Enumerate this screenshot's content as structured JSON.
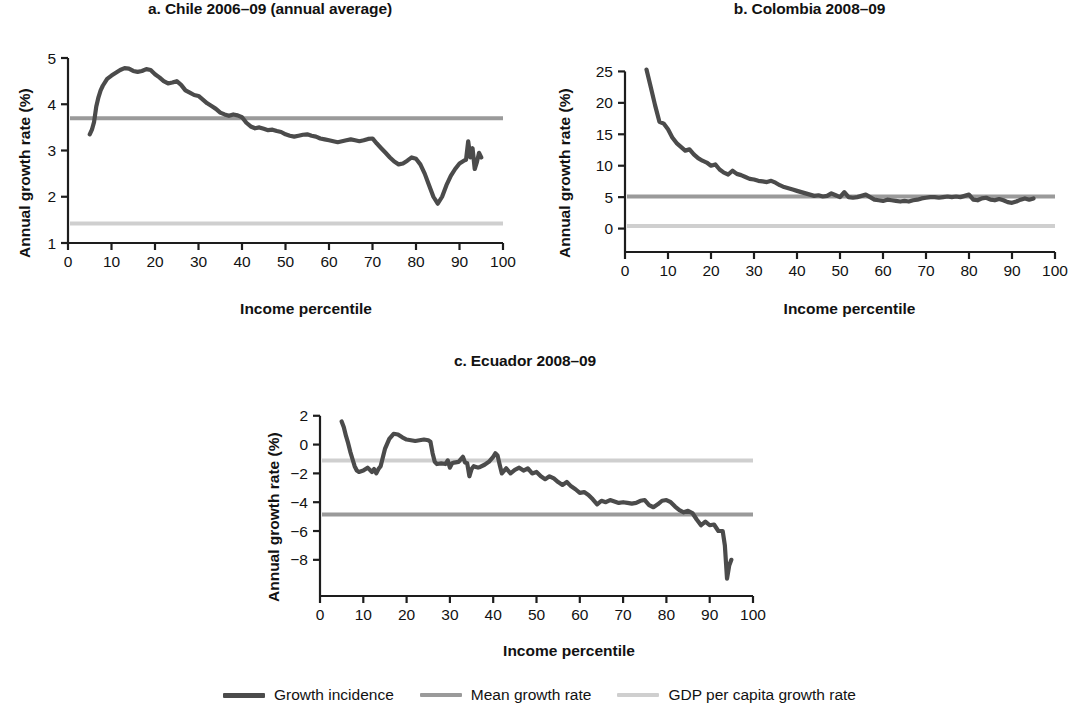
{
  "figure": {
    "legend": {
      "items": [
        {
          "label": "Growth incidence",
          "color": "#4b4b4b",
          "thickness": 5
        },
        {
          "label": "Mean growth rate",
          "color": "#9a9a9a",
          "thickness": 4
        },
        {
          "label": "GDP per capita growth rate",
          "color": "#cfcfcf",
          "thickness": 4
        }
      ]
    }
  },
  "chart_data": [
    {
      "id": "panel-a",
      "type": "line",
      "title": "a. Chile 2006–09 (annual average)",
      "xlabel": "Income percentile",
      "ylabel": "Annual growth rate (%)",
      "xlim": [
        0,
        100
      ],
      "ylim": [
        1,
        5
      ],
      "xticks": [
        0,
        10,
        20,
        30,
        40,
        50,
        60,
        70,
        80,
        90,
        100
      ],
      "yticks": [
        1,
        2,
        3,
        4,
        5
      ],
      "grid": false,
      "legend_position": "below figure",
      "mean_growth_rate": 3.7,
      "gdp_per_capita_growth_rate": 1.42,
      "series": [
        {
          "name": "Growth incidence",
          "color": "#4b4b4b",
          "x": [
            5,
            5.5,
            6,
            6.5,
            7,
            7.5,
            8,
            9,
            10,
            11,
            12,
            13,
            14,
            15,
            16,
            17,
            18,
            19,
            20,
            21,
            22,
            23,
            24,
            25,
            26,
            27,
            28,
            29,
            30,
            31,
            32,
            33,
            34,
            35,
            36,
            37,
            38,
            39,
            40,
            41,
            42,
            43,
            44,
            45,
            46,
            47,
            48,
            49,
            50,
            51,
            52,
            53,
            54,
            55,
            56,
            57,
            58,
            59,
            60,
            61,
            62,
            63,
            64,
            65,
            66,
            67,
            68,
            69,
            70,
            71,
            72,
            73,
            74,
            75,
            76,
            77,
            78,
            79,
            80,
            81,
            82,
            83,
            84,
            85,
            86,
            87,
            88,
            89,
            90,
            91,
            91.5,
            92,
            92.5,
            93,
            93.5,
            94,
            94.5,
            95
          ],
          "y": [
            3.35,
            3.45,
            3.62,
            3.95,
            4.15,
            4.3,
            4.4,
            4.55,
            4.62,
            4.68,
            4.74,
            4.78,
            4.77,
            4.72,
            4.7,
            4.72,
            4.76,
            4.74,
            4.65,
            4.58,
            4.5,
            4.45,
            4.47,
            4.5,
            4.42,
            4.3,
            4.25,
            4.2,
            4.18,
            4.1,
            4.02,
            3.96,
            3.9,
            3.82,
            3.78,
            3.75,
            3.78,
            3.76,
            3.72,
            3.6,
            3.52,
            3.48,
            3.5,
            3.47,
            3.44,
            3.45,
            3.42,
            3.4,
            3.35,
            3.32,
            3.3,
            3.32,
            3.34,
            3.35,
            3.32,
            3.3,
            3.26,
            3.24,
            3.22,
            3.2,
            3.18,
            3.2,
            3.22,
            3.24,
            3.22,
            3.2,
            3.22,
            3.25,
            3.26,
            3.15,
            3.05,
            2.95,
            2.85,
            2.76,
            2.7,
            2.72,
            2.78,
            2.85,
            2.82,
            2.7,
            2.5,
            2.25,
            2.0,
            1.85,
            2.0,
            2.25,
            2.45,
            2.6,
            2.72,
            2.78,
            2.8,
            3.2,
            2.85,
            3.05,
            2.6,
            2.75,
            2.95,
            2.85
          ]
        }
      ]
    },
    {
      "id": "panel-b",
      "type": "line",
      "title": "b. Colombia 2008–09",
      "xlabel": "Income percentile",
      "ylabel": "Annual growth rate (%)",
      "xlim": [
        0,
        100
      ],
      "ylim": [
        -1.5,
        26.5
      ],
      "xticks": [
        0,
        10,
        20,
        30,
        40,
        50,
        60,
        70,
        80,
        90,
        100
      ],
      "yticks": [
        0,
        5,
        10,
        15,
        20,
        25
      ],
      "grid": false,
      "legend_position": "below figure",
      "mean_growth_rate": 5.1,
      "gdp_per_capita_growth_rate": 0.4,
      "series": [
        {
          "name": "Growth incidence",
          "color": "#4b4b4b",
          "x": [
            5,
            6,
            7,
            8,
            9,
            10,
            11,
            12,
            13,
            14,
            15,
            16,
            17,
            18,
            19,
            20,
            21,
            22,
            23,
            24,
            25,
            26,
            27,
            28,
            29,
            30,
            31,
            32,
            33,
            34,
            35,
            36,
            37,
            38,
            39,
            40,
            41,
            42,
            43,
            44,
            45,
            46,
            47,
            48,
            49,
            50,
            51,
            52,
            53,
            54,
            55,
            56,
            57,
            58,
            59,
            60,
            61,
            62,
            63,
            64,
            65,
            66,
            67,
            68,
            69,
            70,
            71,
            72,
            73,
            74,
            75,
            76,
            77,
            78,
            79,
            80,
            81,
            82,
            83,
            84,
            85,
            86,
            87,
            88,
            89,
            90,
            91,
            92,
            93,
            94,
            95
          ],
          "y": [
            25.3,
            22.5,
            19.6,
            17.0,
            16.7,
            15.8,
            14.5,
            13.6,
            13.0,
            12.4,
            12.6,
            11.8,
            11.2,
            10.8,
            10.5,
            10.0,
            10.2,
            9.4,
            8.9,
            8.6,
            9.2,
            8.7,
            8.5,
            8.2,
            7.9,
            7.8,
            7.6,
            7.5,
            7.4,
            7.6,
            7.3,
            6.9,
            6.6,
            6.4,
            6.2,
            6.0,
            5.8,
            5.6,
            5.4,
            5.2,
            5.3,
            5.1,
            5.2,
            5.6,
            5.3,
            5.0,
            5.8,
            5.0,
            4.9,
            5.0,
            5.2,
            5.4,
            5.0,
            4.6,
            4.5,
            4.4,
            4.6,
            4.5,
            4.4,
            4.3,
            4.4,
            4.3,
            4.5,
            4.6,
            4.8,
            4.9,
            5.0,
            5.0,
            4.9,
            5.0,
            5.1,
            5.0,
            5.1,
            5.0,
            5.2,
            5.4,
            4.6,
            4.5,
            4.8,
            4.9,
            4.6,
            4.5,
            4.7,
            4.5,
            4.2,
            4.1,
            4.3,
            4.6,
            4.8,
            4.6,
            4.8
          ]
        }
      ]
    },
    {
      "id": "panel-c",
      "type": "line",
      "title": "c. Ecuador 2008–09",
      "xlabel": "Income percentile",
      "ylabel": "Annual growth rate (%)",
      "xlim": [
        0,
        100
      ],
      "ylim": [
        -9.4,
        2.4
      ],
      "xticks": [
        0,
        10,
        20,
        30,
        40,
        50,
        60,
        70,
        80,
        90,
        100
      ],
      "yticks": [
        2,
        0,
        -2,
        -4,
        -6,
        -8
      ],
      "grid": false,
      "legend_position": "below figure",
      "mean_growth_rate": -4.85,
      "gdp_per_capita_growth_rate": -1.1,
      "series": [
        {
          "name": "Growth incidence",
          "color": "#4b4b4b",
          "x": [
            5,
            5.5,
            6,
            6.5,
            7,
            7.5,
            8,
            8.5,
            9,
            10,
            11,
            12,
            12.5,
            13,
            13.5,
            14,
            15,
            16,
            17,
            18,
            19,
            20,
            21,
            22,
            23,
            24,
            25,
            25.5,
            26,
            26.5,
            27,
            28,
            29,
            29.5,
            30,
            30.5,
            31,
            32,
            33,
            33.5,
            34,
            34.5,
            35,
            35.5,
            36,
            36.5,
            37,
            38,
            39,
            40,
            40.5,
            41,
            41.5,
            42,
            43,
            44,
            45,
            46,
            47,
            48,
            49,
            50,
            51,
            52,
            53,
            54,
            55,
            56,
            57,
            58,
            59,
            60,
            61,
            62,
            63,
            64,
            65,
            66,
            67,
            68,
            69,
            70,
            71,
            72,
            73,
            74,
            75,
            76,
            77,
            78,
            79,
            80,
            81,
            82,
            83,
            84,
            85,
            86,
            87,
            88,
            89,
            90,
            91,
            92,
            93,
            93.5,
            94,
            94.5,
            95
          ],
          "y": [
            1.6,
            1.2,
            0.6,
            0.1,
            -0.5,
            -1.0,
            -1.5,
            -1.8,
            -1.9,
            -1.8,
            -1.6,
            -1.9,
            -1.7,
            -2.0,
            -1.7,
            -1.5,
            -0.3,
            0.4,
            0.75,
            0.7,
            0.5,
            0.35,
            0.3,
            0.25,
            0.3,
            0.35,
            0.3,
            0.2,
            -0.6,
            -1.2,
            -1.35,
            -1.3,
            -1.35,
            -1.1,
            -1.6,
            -1.3,
            -1.25,
            -1.2,
            -0.85,
            -1.25,
            -1.3,
            -2.2,
            -1.7,
            -1.5,
            -1.55,
            -1.6,
            -1.55,
            -1.4,
            -1.2,
            -0.85,
            -0.6,
            -0.75,
            -1.4,
            -2.0,
            -1.65,
            -2.0,
            -1.75,
            -1.6,
            -1.8,
            -1.65,
            -2.0,
            -1.9,
            -2.2,
            -2.4,
            -2.2,
            -2.35,
            -2.6,
            -2.8,
            -2.6,
            -2.9,
            -3.1,
            -3.35,
            -3.3,
            -3.5,
            -3.8,
            -4.15,
            -3.9,
            -4.0,
            -3.85,
            -3.95,
            -4.05,
            -4.0,
            -4.05,
            -4.1,
            -4.05,
            -3.9,
            -3.85,
            -4.2,
            -4.35,
            -4.15,
            -3.9,
            -3.85,
            -4.0,
            -4.3,
            -4.55,
            -4.7,
            -4.6,
            -4.75,
            -5.2,
            -5.6,
            -5.35,
            -5.6,
            -5.55,
            -6.0,
            -6.0,
            -7.0,
            -9.3,
            -8.4,
            -8.0,
            -8.3,
            -7.8
          ]
        }
      ]
    }
  ]
}
